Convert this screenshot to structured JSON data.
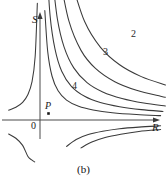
{
  "figure": {
    "caption": "(b)",
    "top_fragment": "",
    "background_color": "#ffffff",
    "line_color": "#3a3a3a",
    "axis_color": "#4a4a4a",
    "text_color": "#1a1a1a"
  },
  "axes": {
    "x_label": "R",
    "y_label": "S",
    "origin_label": "0"
  },
  "annotations": {
    "point_label": "P",
    "point_marker": "filled-square-dot"
  },
  "chart_data": {
    "type": "line",
    "title": "",
    "subtitle": "",
    "xlabel": "R",
    "ylabel": "S",
    "grid": false,
    "legend_position": "inline-curve-labels",
    "xlim": [
      -1.35,
      5.2
    ],
    "ylim": [
      -2.3,
      5.6
    ],
    "origin_px": {
      "x": 40,
      "y": 120
    },
    "annotations": [
      {
        "label": "P",
        "x": 0.45,
        "y": -0.28,
        "kind": "point"
      }
    ],
    "series": [
      {
        "name": "1",
        "label": "",
        "label_shown": false,
        "quadrant": "upper-right",
        "constant": 1.2,
        "x": [
          0.12,
          0.2,
          0.32,
          0.5,
          0.75,
          1.1,
          1.6,
          2.2,
          3.0,
          4.0,
          5.0
        ],
        "y": [
          10.0,
          6.0,
          3.75,
          2.4,
          1.6,
          1.09,
          0.75,
          0.55,
          0.4,
          0.3,
          0.24
        ]
      },
      {
        "name": "2",
        "label": "2",
        "label_shown": true,
        "quadrant": "upper-right",
        "constant": 2.4,
        "x": [
          0.28,
          0.42,
          0.62,
          0.9,
          1.3,
          1.85,
          2.5,
          3.3,
          4.2,
          5.1
        ],
        "y": [
          8.6,
          5.7,
          3.9,
          2.67,
          1.85,
          1.3,
          0.96,
          0.73,
          0.57,
          0.47
        ]
      },
      {
        "name": "3",
        "label": "3",
        "label_shown": true,
        "quadrant": "upper-right",
        "constant": 4.0,
        "x": [
          0.5,
          0.72,
          1.0,
          1.4,
          1.95,
          2.6,
          3.4,
          4.3,
          5.2
        ],
        "y": [
          8.0,
          5.55,
          4.0,
          2.86,
          2.05,
          1.54,
          1.18,
          0.93,
          0.77
        ]
      },
      {
        "name": "4",
        "label": "4",
        "label_shown": true,
        "quadrant": "upper-right",
        "constant": 6.5,
        "x": [
          0.85,
          1.2,
          1.7,
          2.3,
          3.1,
          4.0,
          5.0,
          5.2
        ],
        "y": [
          7.65,
          5.42,
          3.82,
          2.83,
          2.1,
          1.63,
          1.3,
          1.25
        ]
      },
      {
        "name": "5",
        "label": "",
        "label_shown": false,
        "quadrant": "upper-right",
        "constant": 10.0,
        "x": [
          1.35,
          1.85,
          2.5,
          3.3,
          4.2,
          5.2
        ],
        "y": [
          7.4,
          5.4,
          4.0,
          3.03,
          2.38,
          1.92
        ]
      },
      {
        "name": "upper-left-branch",
        "label": "",
        "label_shown": false,
        "quadrant": "upper-left",
        "constant": -0.7,
        "x": [
          -1.3,
          -1.0,
          -0.72,
          -0.5,
          -0.33,
          -0.2,
          -0.11
        ],
        "y": [
          0.54,
          0.7,
          0.97,
          1.4,
          2.1,
          3.5,
          6.4
        ]
      },
      {
        "name": "lower-left-branch",
        "label": "",
        "label_shown": false,
        "quadrant": "lower-left",
        "constant": 1.0,
        "x": [
          -1.3,
          -1.0,
          -0.72,
          -0.5,
          -0.33,
          -0.22
        ],
        "y": [
          -0.77,
          -1.0,
          -1.39,
          -2.0,
          -2.2,
          -2.3
        ]
      },
      {
        "name": "lower-right-branch-inner",
        "label": "",
        "label_shown": false,
        "quadrant": "lower-right",
        "constant": -1.6,
        "x": [
          1.1,
          1.5,
          2.0,
          2.6,
          3.3,
          4.1,
          5.0
        ],
        "y": [
          -1.45,
          -1.07,
          -0.8,
          -0.62,
          -0.48,
          -0.39,
          -0.32
        ]
      },
      {
        "name": "lower-right-branch-outer",
        "label": "",
        "label_shown": false,
        "quadrant": "lower-right",
        "constant": -2.6,
        "x": [
          1.7,
          2.15,
          2.7,
          3.35,
          4.1,
          5.0
        ],
        "y": [
          -1.53,
          -1.21,
          -0.96,
          -0.78,
          -0.63,
          -0.52
        ]
      }
    ]
  }
}
